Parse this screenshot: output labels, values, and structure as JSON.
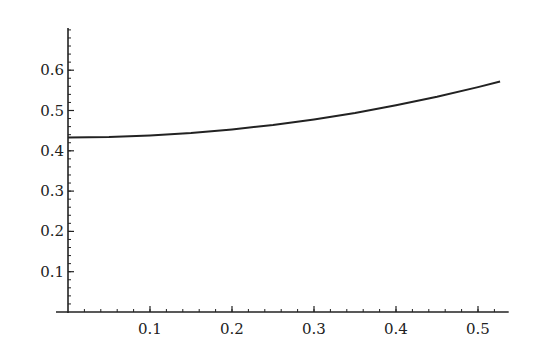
{
  "chart_data": {
    "type": "line",
    "title": "",
    "xlabel": "",
    "ylabel": "",
    "xlim": [
      0,
      0.535
    ],
    "ylim": [
      0,
      0.7
    ],
    "grid": false,
    "legend": null,
    "x_ticks": [
      "0.1",
      "0.2",
      "0.3",
      "0.4",
      "0.5"
    ],
    "y_ticks": [
      "0.1",
      "0.2",
      "0.3",
      "0.4",
      "0.5",
      "0.6"
    ],
    "series": [
      {
        "name": "curve",
        "color": "#222222",
        "x": [
          0.0,
          0.05,
          0.1,
          0.15,
          0.2,
          0.25,
          0.3,
          0.35,
          0.4,
          0.45,
          0.5,
          0.527
        ],
        "y": [
          0.433,
          0.434,
          0.438,
          0.444,
          0.453,
          0.464,
          0.478,
          0.494,
          0.513,
          0.534,
          0.558,
          0.572
        ]
      }
    ]
  }
}
